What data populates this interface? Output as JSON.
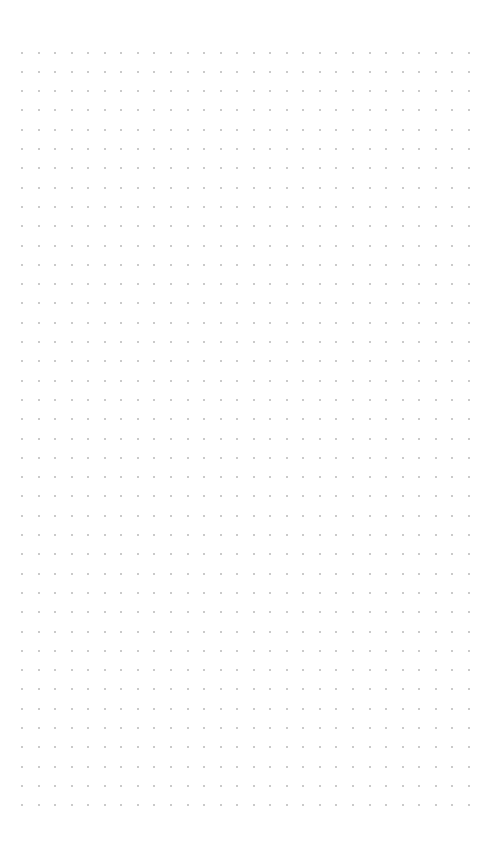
{
  "canvas": {
    "type": "dot-grid",
    "background": "#ffffff",
    "dot_color": "#b8b8b8",
    "dot_size": 2,
    "columns": 28,
    "rows": 40,
    "origin_x": 22,
    "origin_y": 52.5,
    "spacing_x": 16.55,
    "spacing_y": 19.3
  }
}
